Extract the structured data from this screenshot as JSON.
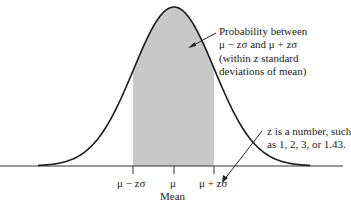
{
  "diagram": {
    "annotations": {
      "shaded_region": {
        "lines": [
          "Probability between",
          "μ − zσ and μ + zσ",
          "(within z standard",
          "deviations of mean)"
        ]
      },
      "z_note": {
        "lines": [
          "z is a number, such",
          "as 1, 2, 3, or 1.43."
        ]
      }
    },
    "axis": {
      "ticks": [
        {
          "label": "μ − zσ",
          "x": 133
        },
        {
          "label": "μ",
          "x": 174
        },
        {
          "label": "μ + zσ",
          "x": 214
        }
      ],
      "mean_label": "Mean"
    },
    "colors": {
      "curve": "#1a1a1a",
      "shade": "#c8c8c8",
      "axis": "#333333"
    }
  }
}
